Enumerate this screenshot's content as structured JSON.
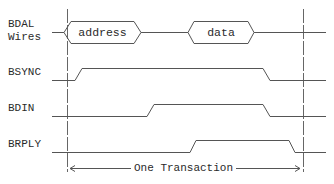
{
  "diagram": {
    "type": "timing-diagram",
    "signals": [
      {
        "name": "BDAL\nWires",
        "kind": "bus",
        "segments": [
          {
            "label": "address"
          },
          {
            "label": "data"
          }
        ]
      },
      {
        "name": "BSYNC",
        "kind": "digital",
        "high_from": "start",
        "high_to": "end"
      },
      {
        "name": "BDIN",
        "kind": "digital",
        "high_from": "middle",
        "high_to": "end"
      },
      {
        "name": "BRPLY",
        "kind": "digital",
        "high_from": "later-middle",
        "high_to": "after-end"
      }
    ],
    "span": {
      "label": "One Transaction"
    },
    "colors": {
      "line": "#555555",
      "text": "#2a2a2a",
      "marker": "#777777"
    }
  }
}
